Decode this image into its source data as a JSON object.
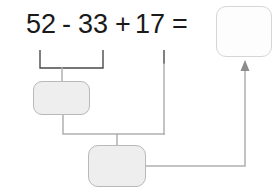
{
  "worksheet": {
    "equation": {
      "operand1": "52",
      "operator1": "-",
      "operand2": "33",
      "operator2": "+",
      "operand3": "17",
      "equals": "="
    },
    "answer_box": {
      "value": "",
      "placeholder": ""
    },
    "steps": [
      {
        "name": "step-1-box",
        "value": "",
        "placeholder": ""
      },
      {
        "name": "step-2-box",
        "value": "",
        "placeholder": ""
      }
    ],
    "colors": {
      "text": "#1a1a1a",
      "step_fill": "#eeeeee",
      "step_border": "#b9b9b9",
      "answer_fill": "#fdfdfd",
      "answer_border": "#d6d6d6",
      "connector": "#b0b0b0",
      "bracket": "#4a4a4a",
      "arrow": "#8c8c8c"
    }
  }
}
